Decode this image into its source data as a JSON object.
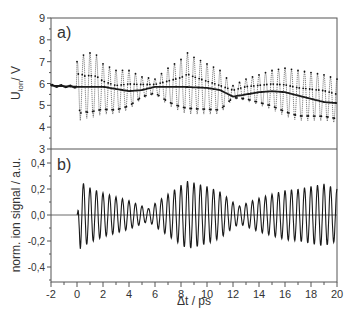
{
  "chart_data": [
    {
      "panel_label": "a)",
      "type": "line",
      "title": "",
      "xlabel": "Δt / ps",
      "ylabel": "U_ion / V",
      "ylabel_main": "U",
      "ylabel_sub": "ion",
      "ylabel_tail": "/ V",
      "xlim": [
        -2,
        20
      ],
      "ylim": [
        3,
        9
      ],
      "yticks": [
        3,
        4,
        5,
        6,
        7,
        8,
        9
      ],
      "ytick_labels": [
        "3",
        "4",
        "5",
        "6",
        "7",
        "8",
        "9"
      ],
      "grid": false,
      "series": [
        {
          "name": "measured ion signal (dots)",
          "style": "dotted line with markers",
          "description": "Fast oscillation (~0.5 ps period) between ~4.3 and ~7.7 V, with amplitude beat: large near 0-1 ps, reduced around 5-6 ps and 12-13 ps, large again near 8-9 ps and 17-20 ps",
          "x": [
            0,
            0.25,
            0.5,
            0.75,
            1,
            1.5,
            2,
            3,
            4,
            5,
            6,
            7,
            8,
            8.5,
            9,
            10,
            11,
            12,
            13,
            14,
            15,
            16,
            17,
            18,
            19,
            20
          ],
          "upper_envelope": [
            7.0,
            7.7,
            7.3,
            7.4,
            7.4,
            7.3,
            6.9,
            6.6,
            6.6,
            6.3,
            6.2,
            6.7,
            7.1,
            7.4,
            7.2,
            6.9,
            6.6,
            5.9,
            6.2,
            6.4,
            6.6,
            6.7,
            6.6,
            6.5,
            6.4,
            6.2
          ],
          "lower_envelope": [
            5.2,
            4.3,
            4.5,
            4.4,
            4.4,
            4.5,
            4.6,
            4.6,
            4.8,
            5.3,
            5.5,
            5.0,
            4.7,
            4.6,
            4.6,
            4.6,
            4.6,
            5.3,
            5.2,
            5.0,
            4.8,
            4.5,
            4.3,
            4.3,
            4.3,
            4.2
          ]
        },
        {
          "name": "slow background (solid)",
          "style": "thick solid line",
          "x": [
            -2,
            0,
            2,
            4,
            5,
            6,
            8,
            10,
            11,
            12,
            13,
            14,
            15,
            16,
            17,
            18,
            19,
            20
          ],
          "values": [
            5.9,
            5.85,
            5.85,
            5.65,
            5.7,
            5.85,
            5.85,
            5.8,
            5.7,
            5.4,
            5.5,
            5.6,
            5.65,
            5.6,
            5.45,
            5.3,
            5.15,
            5.1
          ]
        }
      ]
    },
    {
      "panel_label": "b)",
      "type": "line",
      "title": "",
      "xlabel": "Δt / ps",
      "ylabel": "norm. ion signal / a.u.",
      "xlim": [
        -2,
        20
      ],
      "ylim": [
        -0.5,
        0.45
      ],
      "xticks": [
        -2,
        0,
        2,
        4,
        6,
        8,
        10,
        12,
        14,
        16,
        18,
        20
      ],
      "xtick_labels": [
        "-2",
        "0",
        "2",
        "4",
        "6",
        "8",
        "10",
        "12",
        "14",
        "16",
        "18",
        "20"
      ],
      "yticks": [
        0.4,
        0.2,
        0.0,
        -0.2,
        -0.4
      ],
      "ytick_labels": [
        "0,4",
        "0,2",
        "0,0",
        "-0,2",
        "-0,4"
      ],
      "zero_line": true,
      "grid": false,
      "series": [
        {
          "name": "normalized ion signal (background subtracted)",
          "description": "Oscillation with ~0.5 ps period starting at Δt=0; amplitude ~0.25 near 0 ps, minimum ~0.05 near 5.5 ps, ~0.25 near 8.5 ps, minimum ~0.07 near 12.5 ps, ~0.25 near 18-20 ps",
          "period_ps": 0.5,
          "x": [
            0,
            0.25,
            1,
            2,
            3,
            4,
            5,
            5.5,
            6,
            7,
            8,
            8.5,
            9,
            10,
            11,
            12,
            12.5,
            13,
            14,
            15,
            16,
            17,
            18,
            19,
            20
          ],
          "amplitude": [
            0.0,
            0.26,
            0.21,
            0.17,
            0.14,
            0.11,
            0.07,
            0.05,
            0.09,
            0.16,
            0.23,
            0.26,
            0.25,
            0.22,
            0.18,
            0.1,
            0.07,
            0.09,
            0.13,
            0.16,
            0.19,
            0.2,
            0.22,
            0.24,
            0.2
          ]
        }
      ]
    }
  ],
  "figure": {
    "panel_a_label": "a)",
    "panel_b_label": "b)",
    "xlabel": "Δt / ps",
    "ylabel_a_main": "U",
    "ylabel_a_sub": "ion",
    "ylabel_a_tail": "/ V",
    "ylabel_b": "norm. ion signal / a.u.",
    "line_color": "#1a1a1a",
    "axis_color": "#555555"
  }
}
